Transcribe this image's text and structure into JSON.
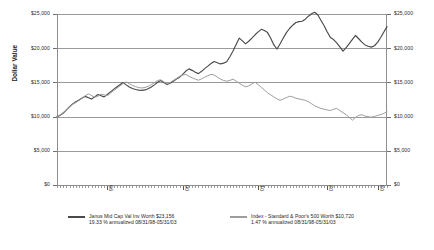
{
  "chart_data": {
    "type": "line",
    "title": "",
    "xlabel": "",
    "ylabel": "Dollar Value",
    "ylim": [
      0,
      25000
    ],
    "ytick_labels": [
      "$25,000",
      "$20,000",
      "$15,000",
      "$10,000",
      "$5,000",
      "$0"
    ],
    "ytick_values": [
      25000,
      20000,
      15000,
      10000,
      5000,
      0
    ],
    "ytick_labels_right": [
      "$25,000",
      "$20,000",
      "$15,000",
      "$10,000",
      "$5,000",
      "$0"
    ],
    "xtick_labels": [
      "99",
      "00",
      "01",
      "02",
      "03"
    ],
    "grid": true,
    "legend_position": "bottom",
    "axis_labels_both_sides": true,
    "series": [
      {
        "name": "Janus Mid Cap Val Inv",
        "color": "#4a4a4a",
        "final_value": 23156,
        "values": [
          10000,
          10180,
          10520,
          10980,
          11450,
          11860,
          12180,
          12420,
          12710,
          12960,
          12760,
          12560,
          12880,
          13220,
          13060,
          12880,
          13240,
          13620,
          13980,
          14320,
          14660,
          14980,
          14640,
          14320,
          14120,
          13960,
          13880,
          13840,
          13900,
          14060,
          14320,
          14640,
          15020,
          15280,
          14980,
          14680,
          14880,
          15180,
          15480,
          15760,
          16180,
          16660,
          16980,
          16760,
          16480,
          16280,
          16620,
          17020,
          17380,
          17760,
          18060,
          17880,
          17700,
          17820,
          18020,
          18760,
          19580,
          20540,
          21480,
          21060,
          20640,
          21020,
          21480,
          21960,
          22380,
          22760,
          22580,
          22280,
          21460,
          20480,
          19880,
          20660,
          21480,
          22280,
          22880,
          23360,
          23760,
          23880,
          23940,
          24240,
          24680,
          25040,
          25260,
          24860,
          24060,
          23280,
          22380,
          21560,
          21260,
          20780,
          20180,
          19560,
          20080,
          20680,
          21280,
          21860,
          21380,
          20880,
          20480,
          20280,
          20160,
          20360,
          20860,
          21560,
          22380,
          23156
        ]
      },
      {
        "name": "Index - Standard & Poor's 500",
        "color": "#9d9d9d",
        "final_value": 10720,
        "values": [
          10000,
          10220,
          10600,
          11020,
          11420,
          11780,
          12060,
          12360,
          12680,
          13060,
          13320,
          13080,
          12820,
          12980,
          13280,
          13180,
          13060,
          13420,
          13780,
          14120,
          14480,
          14820,
          15080,
          14820,
          14560,
          14380,
          14240,
          14180,
          14260,
          14420,
          14680,
          14960,
          15280,
          15380,
          15080,
          14780,
          14980,
          15280,
          15580,
          15880,
          16060,
          16180,
          15880,
          15680,
          15480,
          15320,
          15520,
          15760,
          15980,
          16180,
          16080,
          15780,
          15480,
          15280,
          15180,
          15280,
          15480,
          15180,
          14880,
          14580,
          14360,
          14480,
          14780,
          15020,
          14680,
          14280,
          13880,
          13480,
          13180,
          12880,
          12580,
          12380,
          12560,
          12780,
          12980,
          12880,
          12680,
          12580,
          12480,
          12380,
          12180,
          11880,
          11580,
          11380,
          11180,
          11080,
          10980,
          10880,
          11080,
          11180,
          10880,
          10580,
          10280,
          9880,
          9480,
          9880,
          10180,
          10280,
          10080,
          9980,
          9920,
          10020,
          10180,
          10280,
          10480,
          10720
        ]
      }
    ]
  },
  "axis": {
    "y_title": "Dollar Value"
  },
  "legend": {
    "entries": [
      {
        "line1": "Janus Mid Cap Val Inv Worth $23,156",
        "line2": "19.33 % annualized 08/31/98-05/31/03",
        "color": "#4a4a4a"
      },
      {
        "line1": "Index - Standard & Poor's 500 Worth $10,720",
        "line2": "1.47 % annualized 08/31/98-05/31/03",
        "color": "#9d9d9d"
      }
    ]
  }
}
